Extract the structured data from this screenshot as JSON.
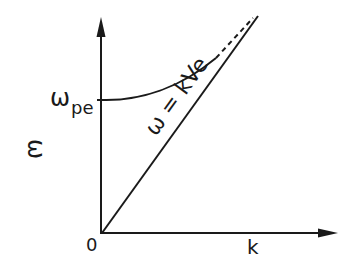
{
  "diagram": {
    "type": "dispersion-relation-sketch",
    "axes": {
      "y_label": "ω",
      "x_label": "k",
      "origin_label": "0"
    },
    "curves": [
      {
        "name": "plasma-dispersion-curve",
        "intercept_label": "ω",
        "intercept_subscript": "pe",
        "style": "solid then dashed asymptote"
      },
      {
        "name": "light-line",
        "label": "ω = kVe",
        "style": "solid straight line through origin"
      }
    ],
    "colors": {
      "ink": "#1a1a1a",
      "background": "#ffffff"
    }
  }
}
